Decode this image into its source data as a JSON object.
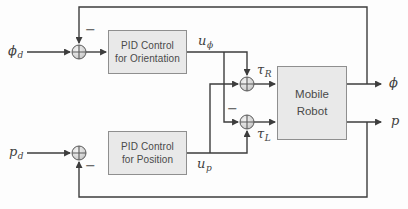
{
  "blocks": {
    "pid_orientation": {
      "line1": "PID Control",
      "line2": "for Orientation"
    },
    "pid_position": {
      "line1": "PID Control",
      "line2": "for Position"
    },
    "mobile_robot": {
      "line1": "Mobile",
      "line2": "Robot"
    }
  },
  "signals": {
    "phi_d": {
      "base": "ϕ",
      "sub": "d"
    },
    "p_d": {
      "base": "p",
      "sub": "d"
    },
    "u_phi": {
      "base": "u",
      "sub": "ϕ"
    },
    "u_p": {
      "base": "u",
      "sub": "p"
    },
    "tau_R": {
      "base": "τ",
      "sub": "R"
    },
    "tau_L": {
      "base": "τ",
      "sub": "L"
    },
    "phi": {
      "base": "ϕ",
      "sub": ""
    },
    "p": {
      "base": "p",
      "sub": ""
    }
  },
  "signs": {
    "minus": "−",
    "plus": "+"
  },
  "colors": {
    "background": "#fdfdfd",
    "line": "#3d3d3d",
    "block_fill": "#e9e9e9",
    "block_border": "#8f8f8f",
    "block_text": "#4a4a4a",
    "junction_stroke": "#5a5a5a"
  }
}
